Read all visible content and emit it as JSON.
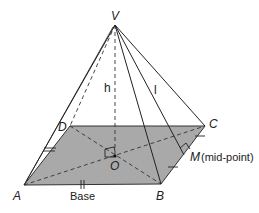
{
  "diagram": {
    "colors": {
      "base_fill": "#a9a9a9",
      "line": "#222222",
      "background": "#ffffff"
    },
    "points": {
      "V": {
        "label": "V",
        "x": 115,
        "y": 25
      },
      "A": {
        "label": "A",
        "x": 24,
        "y": 185
      },
      "B": {
        "label": "B",
        "x": 161,
        "y": 184
      },
      "C": {
        "label": "C",
        "x": 205,
        "y": 126
      },
      "D": {
        "label": "D",
        "x": 70,
        "y": 126
      },
      "O": {
        "label": "O",
        "x": 115,
        "y": 156
      },
      "M": {
        "label": "M",
        "x": 184,
        "y": 155
      }
    },
    "labels": {
      "V": "V",
      "A": "A",
      "B": "B",
      "C": "C",
      "D": "D",
      "O": "O",
      "M": "M",
      "mid_point": "(mid-point)",
      "height": "h",
      "slant": "l",
      "base": "Base"
    }
  }
}
